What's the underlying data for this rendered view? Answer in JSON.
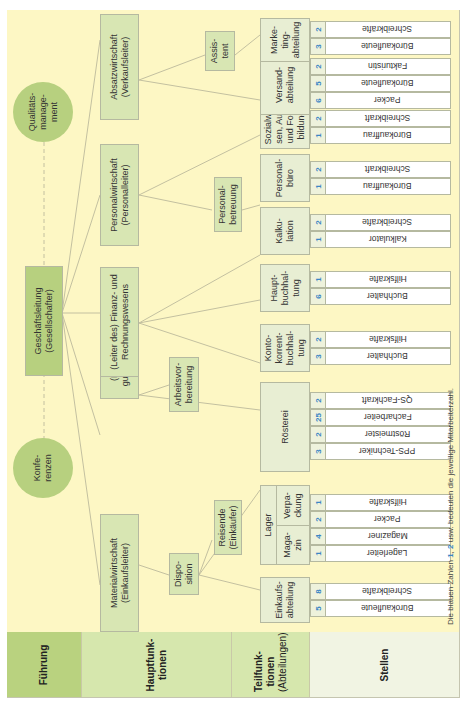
{
  "row_labels": {
    "fuehrung": "Führung",
    "hauptfunktionen": "Hauptfunk-\ntionen",
    "teilfunktionen_title": "Teilfunk-\ntionen",
    "teilfunktionen_sub": "(Abteilungen)",
    "stellen": "Stellen"
  },
  "leadership": {
    "main": "Geschäftsleitung\n(Gesellschafter)",
    "circle_left": "Konfe-\nrenzen",
    "circle_right": "Qualitäts-\nmanage-\nment"
  },
  "main_functions": [
    {
      "label": "Materialwirtschaft\n(Einkaufsleiter)"
    },
    {
      "label": "(Leiter) Ferti-\ngungswirtschaft"
    },
    {
      "label": "(Leiter des) Finanz- und\nRechnungswesens"
    },
    {
      "label": "Personalwirtschaft\n(Personalleiter)"
    },
    {
      "label": "Absatzwirtschaft\n(Verkaufsleiter)"
    }
  ],
  "intermediate": [
    {
      "label": "Dispo-\nsition"
    },
    {
      "label": "Reisende\n(Einkäufer)"
    },
    {
      "label": "Arbeitsvor-\nbereitung"
    },
    {
      "label": "Personal-\nbetreuung"
    },
    {
      "label": "Assis-\ntent"
    }
  ],
  "departments": [
    {
      "label": "Einkaufs-\nabteilung",
      "stellen": [
        {
          "n": "5",
          "label": "Bürokaufleute"
        },
        {
          "n": "8",
          "label": "Schreibkräfte"
        }
      ]
    },
    {
      "label": "Lager",
      "sub": [
        {
          "label": "Maga-\nzin",
          "stellen": [
            {
              "n": "1",
              "label": "Lagerleiter"
            },
            {
              "n": "4",
              "label": "Magaziner"
            }
          ]
        },
        {
          "label": "Verpa-\nckung",
          "stellen": [
            {
              "n": "2",
              "label": "Packer"
            },
            {
              "n": "1",
              "label": "Hilfskräfte"
            }
          ]
        }
      ]
    },
    {
      "label": "Rösterei",
      "stellen": [
        {
          "n": "3",
          "label": "PPS-Techniker"
        },
        {
          "n": "2",
          "label": "Röstmeister"
        },
        {
          "n": "25",
          "label": "Facharbeiter"
        },
        {
          "n": "2",
          "label": "QS-Fachkraft"
        }
      ]
    },
    {
      "label": "Konto-\nkorrent-\nbuchhal-\ntung",
      "stellen": [
        {
          "n": "3",
          "label": "Buchhalter"
        },
        {
          "n": "2",
          "label": "Hilfskräfte"
        }
      ]
    },
    {
      "label": "Haupt-\nbuchhal-\ntung",
      "stellen": [
        {
          "n": "6",
          "label": "Buchhalter"
        },
        {
          "n": "1",
          "label": "Hilfskräfte"
        }
      ]
    },
    {
      "label": "Kalku-\nlation",
      "stellen": [
        {
          "n": "1",
          "label": "Kalkulator"
        },
        {
          "n": "2",
          "label": "Schreibkräfte"
        }
      ]
    },
    {
      "label": "Personal-\nbüro",
      "stellen": [
        {
          "n": "1",
          "label": "Bürokauffrau"
        },
        {
          "n": "2",
          "label": "Schreibkraft"
        }
      ]
    },
    {
      "label": "Sozialwe-\nsen, Aus-\nund Fort-\nbildung",
      "stellen": [
        {
          "n": "1",
          "label": "Bürokauffrau"
        },
        {
          "n": "2",
          "label": "Schreibkraft"
        }
      ]
    },
    {
      "label": "Versand-\nabteilung",
      "stellen": [
        {
          "n": "6",
          "label": "Packer"
        },
        {
          "n": "5",
          "label": "Bürokaufleute"
        },
        {
          "n": "2",
          "label": "Fakturistin"
        }
      ]
    },
    {
      "label": "Marke-\nting-\nabteilung",
      "stellen": [
        {
          "n": "3",
          "label": "Bürokaufleute"
        },
        {
          "n": "2",
          "label": "Schreibkräfte"
        }
      ]
    }
  ],
  "footnote": {
    "pre": "Die blauen Zahlen ",
    "n1": "1",
    "sep": ", ",
    "n2": "2",
    "post": " usw. bedeuten die jeweilige Mitarbeiterzahl."
  },
  "colors": {
    "background": "#fdf7c4",
    "box_dark": "#b7d07f",
    "box_medium": "#d8e6b3",
    "box_light": "#e8eed3",
    "number_blue": "#3a86c5"
  }
}
